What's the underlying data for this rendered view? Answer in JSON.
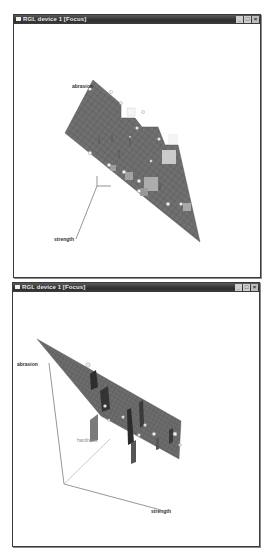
{
  "windows": [
    {
      "id": "rgl-window-1",
      "title": "RGL device 1 [Focus]",
      "controls": {
        "minimize": "_",
        "maximize": "□",
        "close": "×"
      },
      "axes": [
        {
          "name": "abrasion",
          "label": "abrasion"
        },
        {
          "name": "strength",
          "label": "strength"
        }
      ],
      "colors": {
        "plane": "#6e6e6e",
        "grid": "#4e4e4e",
        "axis": "#555555",
        "points": "#f0f0f0",
        "residuals": "#c8c8c8"
      }
    },
    {
      "id": "rgl-window-2",
      "title": "RGL device 1 [Focus]",
      "controls": {
        "minimize": "_",
        "maximize": "□",
        "close": "×"
      },
      "axes": [
        {
          "name": "abrasion",
          "label": "abrasion"
        },
        {
          "name": "hardness",
          "label": "hardness"
        },
        {
          "name": "strength",
          "label": "strength"
        }
      ],
      "colors": {
        "plane": "#6a6a6a",
        "grid": "#4a4a4a",
        "axis": "#555555",
        "axis_light": "#aaaaaa",
        "points": "#eeeeee",
        "residuals": "#3a3a3a"
      }
    }
  ]
}
